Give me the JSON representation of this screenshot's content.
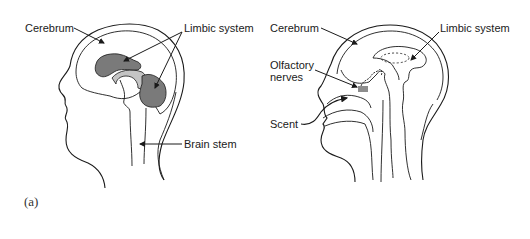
{
  "figure": {
    "caption": "(a)",
    "colors": {
      "line": "#1a1a1a",
      "limbic_fill": "#7a7a7a",
      "secondary_fill": "#c4c4c4",
      "background": "#ffffff"
    },
    "left_panel": {
      "view": "lateral head outline with brain regions",
      "labels": {
        "cerebrum": "Cerebrum",
        "limbic_system": "Limbic system",
        "brain_stem": "Brain stem"
      }
    },
    "right_panel": {
      "view": "sagittal section of head showing olfactory pathway",
      "labels": {
        "cerebrum": "Cerebrum",
        "limbic_system": "Limbic system",
        "olfactory_nerves": "Olfactory\nnerves",
        "scent": "Scent"
      }
    }
  }
}
